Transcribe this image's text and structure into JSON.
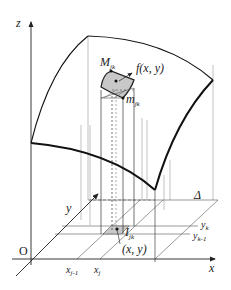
{
  "diagram": {
    "axes": {
      "z_label": "z",
      "x_label": "x",
      "y_label": "y",
      "origin_label": "O"
    },
    "region_label": "Δ",
    "x_ticks": [
      {
        "base": "x",
        "sub": "j-1"
      },
      {
        "base": "x",
        "sub": "j"
      }
    ],
    "y_ticks": [
      {
        "base": "y",
        "sub": "k"
      },
      {
        "base": "y",
        "sub": "k-1"
      }
    ],
    "cell_label": {
      "base": "I",
      "sub": "jk"
    },
    "point_label": "(x, y)",
    "max_label": {
      "base": "M",
      "sub": "jk"
    },
    "min_label": {
      "base": "m",
      "sub": "jk"
    },
    "function_label": "f(x, y)",
    "colors": {
      "line": "#222222",
      "thin_line": "#888888",
      "shade": "#c8c8c8"
    }
  }
}
